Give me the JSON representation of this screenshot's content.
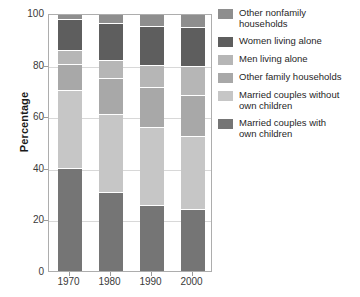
{
  "chart_data": {
    "type": "bar",
    "subtype": "stacked-percentage",
    "title": "",
    "xlabel": "",
    "ylabel": "Percentage",
    "categories": [
      "1970",
      "1980",
      "1990",
      "2000"
    ],
    "ylim": [
      0,
      100
    ],
    "yticks": [
      0,
      20,
      40,
      60,
      80,
      100
    ],
    "grid": true,
    "legend_position": "right",
    "stack_order_bottom_to_top": [
      "Married couples with own children",
      "Married couples without own children",
      "Other family households",
      "Men living alone",
      "Women living alone",
      "Other nonfamily households"
    ],
    "series": [
      {
        "name": "Married couples with own children",
        "color": "#757575",
        "values": [
          40.0,
          30.5,
          25.5,
          24.0
        ]
      },
      {
        "name": "Married couples without own children",
        "color": "#c6c6c6",
        "values": [
          30.5,
          30.5,
          30.5,
          28.5
        ]
      },
      {
        "name": "Other family households",
        "color": "#a8a8a8",
        "values": [
          10.0,
          14.0,
          15.5,
          16.0
        ]
      },
      {
        "name": "Men living alone",
        "color": "#b6b6b6",
        "values": [
          5.5,
          7.0,
          8.5,
          11.0
        ]
      },
      {
        "name": "Women living alone",
        "color": "#5e5e5e",
        "values": [
          12.0,
          14.5,
          15.5,
          15.5
        ]
      },
      {
        "name": "Other nonfamily households",
        "color": "#8e8e8e",
        "values": [
          2.0,
          3.5,
          4.5,
          5.0
        ]
      }
    ]
  },
  "legend": {
    "items": [
      {
        "label": "Other nonfamily\nhouseholds",
        "color": "#8e8e8e"
      },
      {
        "label": "Women living alone",
        "color": "#5e5e5e"
      },
      {
        "label": "Men living alone",
        "color": "#b6b6b6"
      },
      {
        "label": "Other family households",
        "color": "#a8a8a8"
      },
      {
        "label": "Married couples without\nown children",
        "color": "#c6c6c6"
      },
      {
        "label": "Married couples with\nown children",
        "color": "#757575"
      }
    ]
  },
  "axis": {
    "y_title": "Percentage",
    "y_labels": [
      "100",
      "80",
      "60",
      "40",
      "20",
      "0"
    ],
    "x_labels": [
      "1970",
      "1980",
      "1990",
      "2000"
    ]
  },
  "colors": {
    "frame": "#adadad",
    "grid": "#d8d8d8",
    "text": "#1a1a1a",
    "background": "#ffffff"
  }
}
